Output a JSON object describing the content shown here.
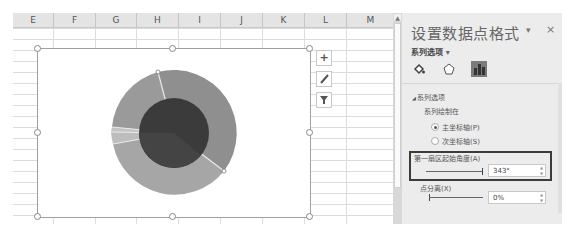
{
  "spreadsheet": {
    "columns": [
      "E",
      "F",
      "G",
      "H",
      "I",
      "J",
      "K",
      "L",
      "M"
    ],
    "column_widths": [
      41,
      41,
      40,
      41,
      41,
      41,
      41,
      41,
      53
    ]
  },
  "chart": {
    "type": "doughnut-pie",
    "chart_elements_button": "+",
    "chart_styles_button": "brush",
    "chart_filters_button": "filter",
    "inner_pie_color": "#3a3a3a",
    "outer_ring_colors": [
      "#8c8c8c",
      "#a9a9a9",
      "#b8b8b8",
      "#c2c2c2",
      "#9e9e9e"
    ]
  },
  "format_pane": {
    "title": "设置数据点格式",
    "dropdown_arrow": "▾",
    "close": "×",
    "series_options_label": "系列选项",
    "tabs": [
      {
        "name": "fill-line",
        "icon": "paint-bucket-icon"
      },
      {
        "name": "effects",
        "icon": "pentagon-icon"
      },
      {
        "name": "series-options",
        "icon": "bar-chart-icon",
        "active": true
      }
    ],
    "section_header": "系列选项",
    "plot_series_on_label": "系列绘制在",
    "primary_axis_label": "主坐标轴(P)",
    "secondary_axis_label": "次坐标轴(S)",
    "primary_axis_selected": true,
    "first_slice_angle_label": "第一扇区起始角度(A)",
    "first_slice_angle_value": "343°",
    "point_explosion_label": "点分离(X)",
    "point_explosion_value": "0%"
  }
}
